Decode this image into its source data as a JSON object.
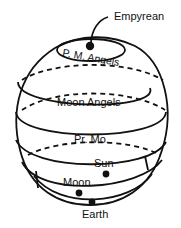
{
  "diagram": {
    "title": "",
    "labels": {
      "empyrean": "Empyrean",
      "pm_angels": "P. M. Angels",
      "moon_angels": "Moon Angels",
      "primum_mobile": "Pr. Mo.",
      "sun": "Sun",
      "moon": "Moon",
      "earth": "Earth"
    },
    "colors": {
      "ink": "#111111",
      "background": "#ffffff"
    }
  }
}
